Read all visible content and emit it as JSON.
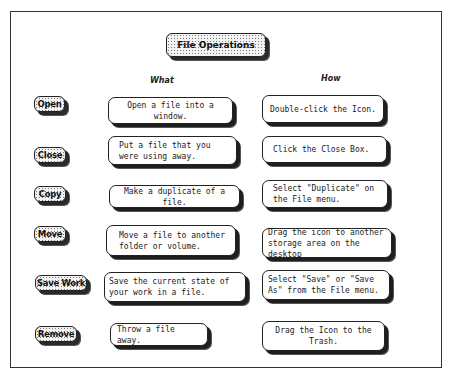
{
  "title": "File Operations",
  "columns": {
    "what": "What",
    "how": "How"
  },
  "rows": [
    {
      "operation": "Open",
      "what": "Open a file into a window.",
      "how": "Double-click the Icon."
    },
    {
      "operation": "Close",
      "what": "Put a file that you were using away.",
      "how": "Click the Close Box."
    },
    {
      "operation": "Copy",
      "what": "Make a duplicate of a file.",
      "how": "Select \"Duplicate\" on the File menu."
    },
    {
      "operation": "Move",
      "what": "Move a file to another folder or volume.",
      "how": "Drag the icon to another storage area on the desktop"
    },
    {
      "operation": "Save Work",
      "what": "Save the current state of your work in a file.",
      "how": "Select \"Save\" or \"Save As\" from the File menu."
    },
    {
      "operation": "Remove",
      "what": "Throw a file away.",
      "how": "Drag the Icon to the Trash."
    }
  ],
  "colors": {
    "border": "#222222",
    "shadow": "#1e1e1e",
    "pattern_fill": "#f2f2f2",
    "background": "#ffffff"
  }
}
